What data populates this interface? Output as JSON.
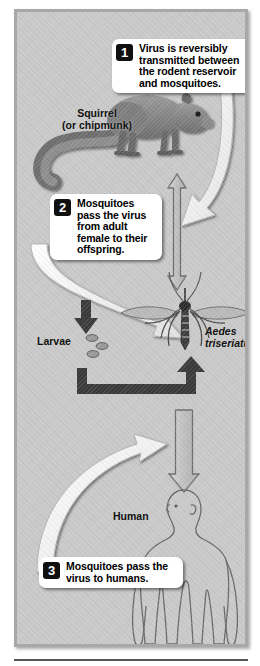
{
  "figure": {
    "background_color": "#c9c9c9",
    "frame_border_color": "#a8a8a8"
  },
  "callouts": [
    {
      "number": "1",
      "text": "Virus is reversibly transmitted between the rodent reservoir and mosquitoes."
    },
    {
      "number": "2",
      "text": "Mosquitoes pass the virus from adult female to their offspring."
    },
    {
      "number": "3",
      "text": "Mosquitoes pass the virus to humans."
    }
  ],
  "labels": {
    "squirrel": "Squirrel\n(or chipmunk)",
    "squirrel_line1": "Squirrel",
    "squirrel_line2": "(or chipmunk)",
    "larvae": "Larvae",
    "aedes_genus": "Aedes",
    "aedes_species": "triseriatus",
    "human": "Human"
  },
  "organisms": [
    {
      "name": "squirrel",
      "label": "Squirrel (or chipmunk)"
    },
    {
      "name": "mosquito-adult",
      "label": "Aedes triseriatus"
    },
    {
      "name": "mosquito-larvae",
      "label": "Larvae"
    },
    {
      "name": "human",
      "label": "Human"
    }
  ],
  "arrows": [
    {
      "name": "squirrel-mosquito-bidirectional",
      "style": "outline-double-headed",
      "direction": "vertical"
    },
    {
      "name": "callout1-to-mosquito",
      "style": "white-curved",
      "direction": "down-left"
    },
    {
      "name": "callout2-to-mosquito",
      "style": "white-curved",
      "direction": "down-right"
    },
    {
      "name": "adult-to-larvae",
      "style": "solid-dark",
      "direction": "down"
    },
    {
      "name": "larvae-to-adult",
      "style": "solid-dark-elbow",
      "direction": "right-up"
    },
    {
      "name": "mosquito-to-human",
      "style": "outline",
      "direction": "down"
    },
    {
      "name": "callout3-to-mosquito",
      "style": "white-curved",
      "direction": "up-right"
    }
  ],
  "colors": {
    "background": "#c9c9c9",
    "callout_bg": "#ffffff",
    "number_badge": "#101010",
    "arrow_dark": "#3a3a3a",
    "arrow_white": "#ffffff",
    "outline": "#707070"
  }
}
